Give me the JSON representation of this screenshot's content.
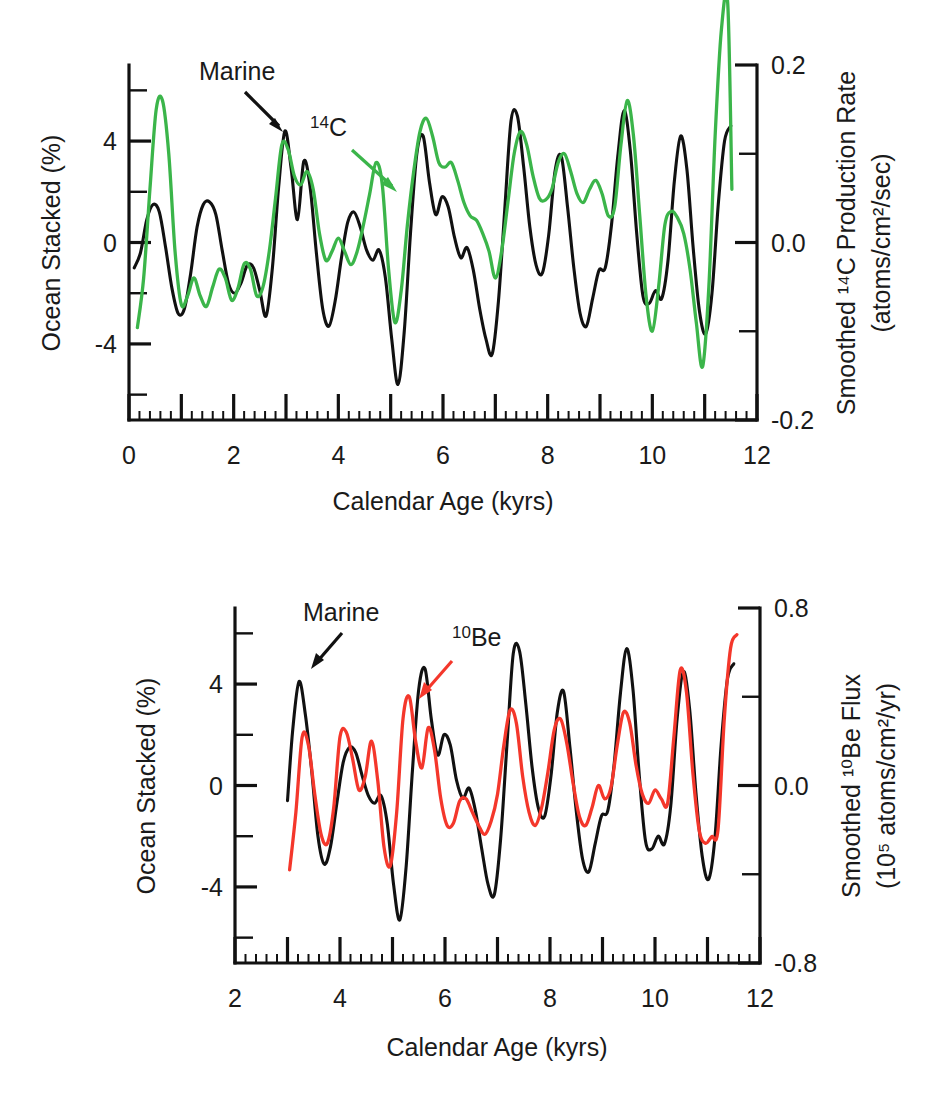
{
  "figure": {
    "panels": [
      {
        "id": "top",
        "xlabel": "Calendar Age (kyrs)",
        "ylabel_left": "Ocean Stacked (%)",
        "ylabel_right_line1": "Smoothed ¹⁴C Production Rate",
        "ylabel_right_line2": "(atoms/cm²/sec)",
        "right_color": "#3bb54a",
        "annotations": [
          {
            "text": "Marine",
            "color": "#111111"
          },
          {
            "text": "¹⁴C",
            "color": "#3bb54a"
          }
        ],
        "x_ticklabels": [
          "0",
          "2",
          "4",
          "6",
          "8",
          "10",
          "12"
        ],
        "y_left_ticklabels": [
          "4",
          "0",
          "-4"
        ],
        "y_right_ticklabels": [
          "0.2",
          "0.0",
          "-0.2"
        ]
      },
      {
        "id": "bottom",
        "xlabel": "Calendar Age (kyrs)",
        "ylabel_left": "Ocean Stacked (%)",
        "ylabel_right_line1": "Smoothed ¹⁰Be Flux",
        "ylabel_right_line2": "(10⁵ atoms/cm²/yr)",
        "right_color": "#f4372b",
        "annotations": [
          {
            "text": "Marine",
            "color": "#111111"
          },
          {
            "text": "¹⁰Be",
            "color": "#f4372b"
          }
        ],
        "x_ticklabels": [
          "2",
          "4",
          "6",
          "8",
          "10",
          "12"
        ],
        "y_left_ticklabels": [
          "4",
          "0",
          "-4"
        ],
        "y_right_ticklabels": [
          "0.8",
          "0.0",
          "-0.8"
        ]
      }
    ]
  },
  "chart_data": [
    {
      "type": "line",
      "panel": "top",
      "title": "",
      "xlabel": "Calendar Age (kyrs)",
      "ylabel": "Ocean Stacked (%)",
      "ylabel_right": "Smoothed 14C Production Rate (atoms/cm2/sec)",
      "grid": false,
      "legend": "inline-annotations",
      "xlim": [
        0,
        12
      ],
      "ylim": [
        -7,
        7
      ],
      "ylim_right": [
        -0.2,
        0.2
      ],
      "xticks": [
        0,
        2,
        4,
        6,
        8,
        10,
        12
      ],
      "yticks_left": [
        4,
        0,
        -4
      ],
      "yticks_right": [
        0.2,
        0.0,
        -0.2
      ],
      "series": [
        {
          "name": "Marine",
          "color": "#111111",
          "axis": "left",
          "x": [
            0.1,
            0.22,
            0.34,
            0.46,
            0.58,
            0.7,
            0.82,
            0.94,
            1.06,
            1.18,
            1.3,
            1.42,
            1.54,
            1.66,
            1.78,
            1.9,
            2.02,
            2.14,
            2.26,
            2.38,
            2.5,
            2.62,
            2.74,
            2.86,
            2.98,
            3.1,
            3.22,
            3.34,
            3.46,
            3.58,
            3.7,
            3.82,
            3.94,
            4.06,
            4.18,
            4.3,
            4.42,
            4.54,
            4.66,
            4.78,
            4.9,
            5.02,
            5.14,
            5.26,
            5.38,
            5.5,
            5.62,
            5.74,
            5.86,
            5.98,
            6.1,
            6.22,
            6.34,
            6.46,
            6.58,
            6.7,
            6.82,
            6.94,
            7.06,
            7.18,
            7.3,
            7.42,
            7.54,
            7.66,
            7.78,
            7.9,
            8.02,
            8.14,
            8.26,
            8.38,
            8.5,
            8.62,
            8.74,
            8.86,
            8.98,
            9.1,
            9.22,
            9.34,
            9.46,
            9.58,
            9.7,
            9.82,
            9.94,
            10.06,
            10.18,
            10.3,
            10.42,
            10.54,
            10.66,
            10.78,
            10.9,
            11.02,
            11.14,
            11.26,
            11.38,
            11.5
          ],
          "y": [
            -1.0,
            -0.4,
            0.9,
            1.5,
            1.2,
            -0.2,
            -1.8,
            -2.8,
            -2.6,
            -1.2,
            0.6,
            1.5,
            1.6,
            1.1,
            -0.3,
            -1.6,
            -2.0,
            -1.6,
            -0.9,
            -1.0,
            -1.9,
            -2.9,
            -1.0,
            2.2,
            4.4,
            2.9,
            0.9,
            3.2,
            2.2,
            -0.4,
            -2.6,
            -3.3,
            -2.3,
            -0.6,
            0.8,
            1.2,
            0.6,
            -0.3,
            -0.7,
            -0.3,
            -1.4,
            -3.8,
            -5.6,
            -3.5,
            0.4,
            3.5,
            4.2,
            2.4,
            1.1,
            1.8,
            1.4,
            0.2,
            -0.6,
            -0.2,
            -1.1,
            -2.6,
            -3.8,
            -4.4,
            -2.3,
            1.3,
            4.8,
            5.0,
            3.0,
            0.6,
            -0.9,
            -1.2,
            0.3,
            2.8,
            3.4,
            1.4,
            -1.0,
            -2.8,
            -3.3,
            -2.2,
            -1.1,
            -1.0,
            0.7,
            3.4,
            5.2,
            3.6,
            0.4,
            -2.1,
            -2.4,
            -1.9,
            -2.2,
            -0.7,
            2.4,
            4.2,
            2.9,
            -0.2,
            -2.7,
            -3.6,
            -2.0,
            1.5,
            4.0,
            4.6,
            3.9
          ]
        },
        {
          "name": "14C",
          "color": "#3bb54a",
          "axis": "right",
          "x": [
            0.16,
            0.28,
            0.4,
            0.52,
            0.64,
            0.76,
            0.88,
            1.0,
            1.12,
            1.24,
            1.36,
            1.48,
            1.6,
            1.72,
            1.84,
            1.96,
            2.08,
            2.2,
            2.32,
            2.44,
            2.56,
            2.68,
            2.8,
            2.92,
            3.04,
            3.16,
            3.28,
            3.4,
            3.52,
            3.64,
            3.76,
            3.88,
            4.0,
            4.12,
            4.24,
            4.36,
            4.48,
            4.6,
            4.72,
            4.84,
            4.96,
            5.08,
            5.2,
            5.32,
            5.44,
            5.56,
            5.68,
            5.8,
            5.92,
            6.04,
            6.16,
            6.28,
            6.4,
            6.52,
            6.64,
            6.76,
            6.88,
            7.0,
            7.12,
            7.24,
            7.36,
            7.48,
            7.6,
            7.72,
            7.84,
            7.96,
            8.08,
            8.2,
            8.32,
            8.44,
            8.56,
            8.68,
            8.8,
            8.92,
            9.04,
            9.16,
            9.28,
            9.4,
            9.52,
            9.64,
            9.76,
            9.88,
            10.0,
            10.12,
            10.24,
            10.36,
            10.48,
            10.6,
            10.72,
            10.84,
            10.96,
            11.08,
            11.2,
            11.32,
            11.44,
            11.52
          ],
          "y": [
            -0.096,
            -0.04,
            0.06,
            0.15,
            0.16,
            0.1,
            -0.01,
            -0.07,
            -0.06,
            -0.04,
            -0.06,
            -0.072,
            -0.05,
            -0.03,
            -0.04,
            -0.065,
            -0.052,
            -0.024,
            -0.03,
            -0.06,
            -0.05,
            -0.01,
            0.05,
            0.11,
            0.105,
            0.075,
            0.065,
            0.08,
            0.06,
            0.01,
            -0.02,
            -0.01,
            0.005,
            -0.01,
            -0.025,
            -0.01,
            0.02,
            0.055,
            0.09,
            0.065,
            -0.03,
            -0.09,
            -0.055,
            0.02,
            0.08,
            0.125,
            0.14,
            0.12,
            0.09,
            0.085,
            0.09,
            0.07,
            0.045,
            0.03,
            0.025,
            0.01,
            -0.01,
            -0.04,
            -0.01,
            0.045,
            0.1,
            0.125,
            0.11,
            0.075,
            0.05,
            0.048,
            0.06,
            0.09,
            0.1,
            0.08,
            0.055,
            0.045,
            0.06,
            0.07,
            0.055,
            0.03,
            0.04,
            0.11,
            0.16,
            0.12,
            0.03,
            -0.06,
            -0.1,
            -0.05,
            0.02,
            0.035,
            0.028,
            0.01,
            -0.03,
            -0.09,
            -0.14,
            -0.05,
            0.12,
            0.24,
            0.27,
            0.06,
            -0.13
          ]
        }
      ]
    },
    {
      "type": "line",
      "panel": "bottom",
      "title": "",
      "xlabel": "Calendar Age (kyrs)",
      "ylabel": "Ocean Stacked (%)",
      "ylabel_right": "Smoothed 10Be Flux (10^5 atoms/cm2/yr)",
      "grid": false,
      "legend": "inline-annotations",
      "xlim": [
        2,
        12
      ],
      "ylim": [
        -7,
        7
      ],
      "ylim_right": [
        -0.8,
        0.8
      ],
      "xticks": [
        2,
        4,
        6,
        8,
        10,
        12
      ],
      "yticks_left": [
        4,
        0,
        -4
      ],
      "yticks_right": [
        0.8,
        0.0,
        -0.8
      ],
      "series": [
        {
          "name": "Marine",
          "color": "#111111",
          "axis": "left",
          "x": [
            3.0,
            3.1,
            3.22,
            3.34,
            3.46,
            3.58,
            3.7,
            3.82,
            3.94,
            4.06,
            4.18,
            4.3,
            4.42,
            4.54,
            4.66,
            4.78,
            4.9,
            5.02,
            5.14,
            5.26,
            5.38,
            5.5,
            5.62,
            5.74,
            5.86,
            5.98,
            6.1,
            6.22,
            6.34,
            6.46,
            6.58,
            6.7,
            6.82,
            6.94,
            7.06,
            7.18,
            7.3,
            7.42,
            7.54,
            7.66,
            7.78,
            7.9,
            8.02,
            8.14,
            8.26,
            8.38,
            8.5,
            8.62,
            8.74,
            8.86,
            8.98,
            9.1,
            9.22,
            9.34,
            9.46,
            9.58,
            9.7,
            9.82,
            9.94,
            10.06,
            10.18,
            10.3,
            10.42,
            10.54,
            10.66,
            10.78,
            10.9,
            11.02,
            11.14,
            11.26,
            11.38,
            11.5
          ],
          "y": [
            -0.6,
            2.2,
            4.1,
            2.8,
            0.6,
            -2.0,
            -3.1,
            -2.4,
            -0.7,
            0.9,
            1.5,
            1.3,
            0.4,
            -0.4,
            -0.7,
            -0.4,
            -1.5,
            -3.9,
            -5.3,
            -3.2,
            0.6,
            3.8,
            4.6,
            2.6,
            1.2,
            2.0,
            1.6,
            0.2,
            -0.5,
            -0.1,
            -1.0,
            -2.5,
            -3.9,
            -4.3,
            -2.1,
            1.6,
            5.2,
            5.3,
            3.2,
            0.7,
            -0.9,
            -1.2,
            0.4,
            2.9,
            3.7,
            1.5,
            -1.0,
            -2.9,
            -3.4,
            -2.3,
            -1.2,
            -1.0,
            0.8,
            3.6,
            5.4,
            3.8,
            0.4,
            -2.2,
            -2.5,
            -2.0,
            -2.3,
            -0.8,
            2.6,
            4.5,
            3.0,
            -0.3,
            -2.8,
            -3.7,
            -2.1,
            1.6,
            4.2,
            4.8
          ]
        },
        {
          "name": "10Be",
          "color": "#f4372b",
          "axis": "right",
          "x": [
            3.04,
            3.16,
            3.28,
            3.4,
            3.52,
            3.64,
            3.76,
            3.88,
            4.0,
            4.12,
            4.24,
            4.36,
            4.48,
            4.6,
            4.72,
            4.84,
            4.96,
            5.08,
            5.2,
            5.32,
            5.44,
            5.56,
            5.68,
            5.8,
            5.92,
            6.04,
            6.16,
            6.28,
            6.4,
            6.52,
            6.64,
            6.76,
            6.88,
            7.0,
            7.12,
            7.24,
            7.36,
            7.48,
            7.6,
            7.72,
            7.84,
            7.96,
            8.08,
            8.2,
            8.32,
            8.44,
            8.56,
            8.68,
            8.8,
            8.92,
            9.04,
            9.16,
            9.28,
            9.4,
            9.52,
            9.64,
            9.76,
            9.88,
            10.0,
            10.12,
            10.24,
            10.36,
            10.48,
            10.6,
            10.72,
            10.84,
            10.96,
            11.08,
            11.2,
            11.32,
            11.44,
            11.56
          ],
          "y": [
            -0.38,
            -0.12,
            0.22,
            0.18,
            -0.04,
            -0.22,
            -0.26,
            -0.1,
            0.22,
            0.24,
            0.12,
            -0.02,
            0.04,
            0.2,
            0.02,
            -0.28,
            -0.36,
            -0.12,
            0.3,
            0.4,
            0.2,
            0.08,
            0.26,
            0.16,
            -0.06,
            -0.18,
            -0.17,
            -0.07,
            -0.06,
            -0.12,
            -0.18,
            -0.22,
            -0.16,
            -0.04,
            0.18,
            0.34,
            0.28,
            0.04,
            -0.12,
            -0.18,
            -0.1,
            0.06,
            0.25,
            0.3,
            0.19,
            0.01,
            -0.14,
            -0.18,
            -0.1,
            0.0,
            -0.06,
            -0.01,
            0.18,
            0.33,
            0.28,
            0.09,
            -0.04,
            -0.08,
            -0.02,
            -0.06,
            -0.08,
            0.22,
            0.52,
            0.42,
            0.06,
            -0.2,
            -0.26,
            -0.23,
            -0.2,
            0.3,
            0.62,
            0.68
          ]
        }
      ]
    }
  ]
}
